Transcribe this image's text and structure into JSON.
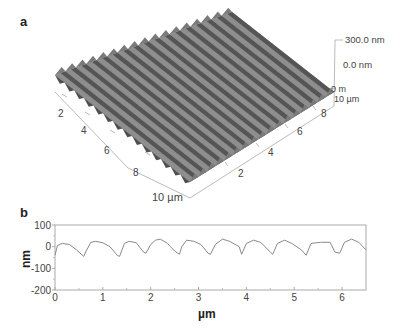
{
  "figure": {
    "panel_a": {
      "label": "a",
      "x_axis_ticks": [
        "2",
        "4",
        "6",
        "8",
        "10 µm"
      ],
      "y_axis_ticks": [
        "2",
        "4",
        "6",
        "8",
        "10 µm"
      ],
      "z_axis_labels": [
        "300.0 nm",
        "0.0 nm"
      ],
      "corner_labels": [
        "0 m",
        "10 µm"
      ]
    },
    "panel_b": {
      "label": "b",
      "ylabel": "nm",
      "xlabel": "µm"
    }
  },
  "chart_data": [
    {
      "type": "surface",
      "title": "3D AFM topography",
      "x_ticks": [
        2,
        4,
        6,
        8,
        10
      ],
      "y_ticks": [
        2,
        4,
        6,
        8,
        10
      ],
      "x_unit": "µm",
      "y_unit": "µm",
      "z_range_nm": [
        0.0,
        300.0
      ],
      "description": "periodic ridges (grating) ~16 ridges across 10 µm"
    },
    {
      "type": "line",
      "title": "",
      "xlabel": "µm",
      "ylabel": "nm",
      "xlim": [
        0,
        6.5
      ],
      "ylim": [
        -200,
        100
      ],
      "x_ticks": [
        0,
        1,
        2,
        3,
        4,
        5,
        6
      ],
      "y_ticks": [
        100,
        0,
        -100,
        -200
      ],
      "grid": false,
      "series": [
        {
          "name": "profile",
          "x": [
            0.0,
            0.05,
            0.15,
            0.3,
            0.45,
            0.6,
            0.65,
            0.75,
            0.85,
            1.0,
            1.15,
            1.3,
            1.35,
            1.45,
            1.55,
            1.7,
            1.85,
            1.9,
            2.0,
            2.1,
            2.2,
            2.35,
            2.5,
            2.6,
            2.65,
            2.75,
            2.9,
            3.05,
            3.2,
            3.25,
            3.35,
            3.5,
            3.65,
            3.85,
            3.9,
            4.0,
            4.15,
            4.3,
            4.5,
            4.55,
            4.65,
            4.8,
            4.95,
            5.15,
            5.25,
            5.35,
            5.55,
            5.75,
            5.85,
            5.95,
            6.05,
            6.2,
            6.35,
            6.5
          ],
          "values": [
            -40,
            5,
            15,
            10,
            -15,
            -45,
            -20,
            20,
            25,
            18,
            0,
            -40,
            -45,
            15,
            25,
            18,
            -25,
            -30,
            10,
            30,
            35,
            15,
            -20,
            -35,
            0,
            30,
            25,
            10,
            -30,
            -35,
            10,
            35,
            25,
            0,
            -35,
            15,
            30,
            20,
            -25,
            -35,
            15,
            30,
            15,
            -15,
            -40,
            15,
            20,
            20,
            -25,
            -30,
            20,
            35,
            20,
            -15
          ]
        }
      ]
    }
  ]
}
